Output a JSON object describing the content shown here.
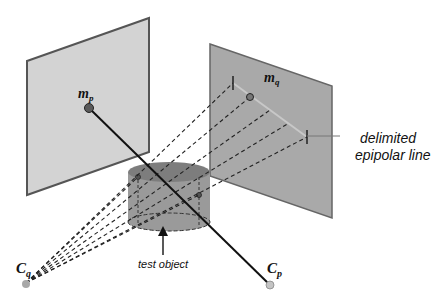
{
  "labels": {
    "mp": {
      "base": "m",
      "sub": "p"
    },
    "mq": {
      "base": "m",
      "sub": "q"
    },
    "cq": {
      "base": "C",
      "sub": "q"
    },
    "cp": {
      "base": "C",
      "sub": "p"
    },
    "epipolar_line_1": "delimited",
    "epipolar_line_2": "epipolar line",
    "test_object": "test object"
  },
  "colors": {
    "left_plane_fill": "#d3d3d3",
    "right_plane_fill": "#a9a9a9",
    "plane_border": "#555555",
    "cylinder_body": "#9a9a9a",
    "cylinder_top": "#7d7d7d",
    "ray_color": "#222222",
    "camera_point": "#b0b0b0",
    "image_point": "#6a6a6a"
  }
}
